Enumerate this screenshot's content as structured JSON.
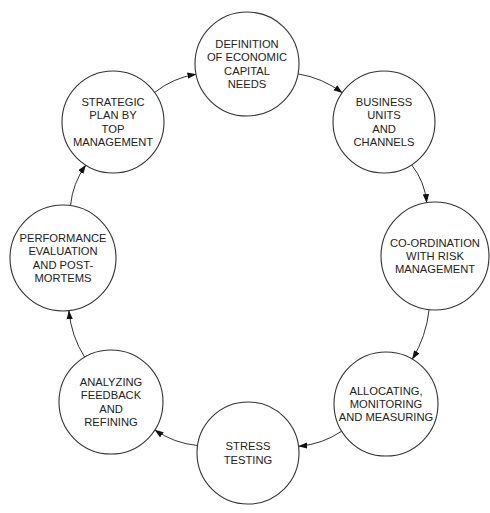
{
  "diagram": {
    "type": "cycle",
    "title": "",
    "nodes": [
      {
        "id": "definition",
        "lines": [
          "DEFINITION",
          "OF ECONOMIC",
          "CAPITAL",
          "NEEDS"
        ]
      },
      {
        "id": "business-units",
        "lines": [
          "BUSINESS",
          "UNITS",
          "AND",
          "CHANNELS"
        ]
      },
      {
        "id": "coordination",
        "lines": [
          "CO-ORDINATION",
          "WITH RISK",
          "MANAGEMENT"
        ]
      },
      {
        "id": "allocating",
        "lines": [
          "ALLOCATING,",
          "MONITORING",
          "AND MEASURING"
        ]
      },
      {
        "id": "stress-testing",
        "lines": [
          "STRESS",
          "TESTING"
        ]
      },
      {
        "id": "analyzing",
        "lines": [
          "ANALYZING",
          "FEEDBACK",
          "AND",
          "REFINING"
        ]
      },
      {
        "id": "performance",
        "lines": [
          "PERFORMANCE",
          "EVALUATION",
          "AND POST-",
          "MORTEMS"
        ]
      },
      {
        "id": "strategic-plan",
        "lines": [
          "STRATEGIC",
          "PLAN BY",
          "TOP",
          "MANAGEMENT"
        ]
      }
    ],
    "edges": [
      {
        "from": "definition",
        "to": "business-units"
      },
      {
        "from": "business-units",
        "to": "coordination"
      },
      {
        "from": "coordination",
        "to": "allocating"
      },
      {
        "from": "allocating",
        "to": "stress-testing"
      },
      {
        "from": "stress-testing",
        "to": "analyzing"
      },
      {
        "from": "analyzing",
        "to": "performance"
      },
      {
        "from": "performance",
        "to": "strategic-plan"
      },
      {
        "from": "strategic-plan",
        "to": "definition"
      }
    ],
    "direction": "clockwise"
  }
}
